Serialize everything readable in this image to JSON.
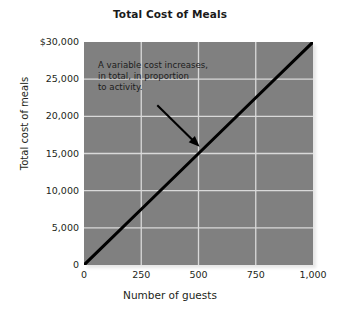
{
  "chart_data": {
    "type": "line",
    "title": "Total Cost of Meals",
    "xlabel": "Number of guests",
    "ylabel": "Total cost of meals",
    "xlim": [
      0,
      1000
    ],
    "ylim": [
      0,
      30000
    ],
    "grid": true,
    "legend": "none",
    "background_color": "#808080",
    "gridline_color": "#d9d9d9",
    "line_color": "#000000",
    "x_ticks": [
      {
        "value": 0,
        "label": "0"
      },
      {
        "value": 250,
        "label": "250"
      },
      {
        "value": 500,
        "label": "500"
      },
      {
        "value": 750,
        "label": "750"
      },
      {
        "value": 1000,
        "label": "1,000"
      }
    ],
    "y_ticks": [
      {
        "value": 30000,
        "label": "$30,000"
      },
      {
        "value": 25000,
        "label": "25,000"
      },
      {
        "value": 20000,
        "label": "20,000"
      },
      {
        "value": 15000,
        "label": "15,000"
      },
      {
        "value": 10000,
        "label": "10,000"
      },
      {
        "value": 5000,
        "label": "5,000"
      },
      {
        "value": 0,
        "label": "0"
      }
    ],
    "series": [
      {
        "name": "Total cost of meals",
        "x": [
          0,
          250,
          500,
          750,
          1000
        ],
        "values": [
          0,
          7500,
          15000,
          22500,
          30000
        ]
      }
    ],
    "annotations": [
      {
        "text": "A variable cost increases,\nin total, in proportion\nto activity.",
        "arrow_from": {
          "x": 320,
          "y": 21500
        },
        "arrow_to": {
          "x": 505,
          "y": 15900
        }
      }
    ]
  }
}
